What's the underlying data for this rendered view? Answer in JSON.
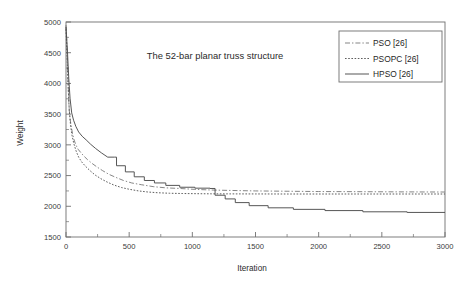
{
  "chart_data": {
    "type": "line",
    "title": "The 52-bar planar truss structure",
    "xlabel": "Iteration",
    "ylabel": "Weight",
    "xlim": [
      0,
      3000
    ],
    "ylim": [
      1500,
      5000
    ],
    "xticks": [
      0,
      500,
      1000,
      1500,
      2000,
      2500,
      3000
    ],
    "yticks": [
      1500,
      2000,
      2500,
      3000,
      3500,
      4000,
      4500,
      5000
    ],
    "xtick_labels": [
      "0",
      "500",
      "1000",
      "1500",
      "2000",
      "2500",
      "3000"
    ],
    "ytick_labels": [
      "1500",
      "2000",
      "2500",
      "3000",
      "3500",
      "4000",
      "4500",
      "5000"
    ],
    "grid": false,
    "legend_position": "top-right",
    "series": [
      {
        "name": "PSO [26]",
        "style": "dash-dot",
        "color": "#808080",
        "x": [
          0,
          8,
          14,
          20,
          26,
          34,
          42,
          52,
          64,
          78,
          95,
          115,
          140,
          170,
          205,
          245,
          290,
          340,
          395,
          455,
          520,
          600,
          690,
          790,
          900,
          1020,
          1150,
          1300,
          1500,
          1750,
          2000,
          2300,
          2600,
          3000
        ],
        "y": [
          4950,
          4600,
          4180,
          3820,
          3560,
          3400,
          3290,
          3180,
          3080,
          3000,
          2930,
          2880,
          2820,
          2760,
          2700,
          2640,
          2580,
          2520,
          2470,
          2420,
          2380,
          2350,
          2320,
          2300,
          2290,
          2275,
          2265,
          2258,
          2250,
          2245,
          2240,
          2238,
          2235,
          2232
        ]
      },
      {
        "name": "PSOPC [26]",
        "style": "dotted",
        "color": "#555555",
        "x": [
          0,
          10,
          18,
          26,
          36,
          48,
          62,
          80,
          100,
          125,
          155,
          190,
          230,
          275,
          325,
          380,
          440,
          505,
          575,
          650,
          730,
          820,
          920,
          1030,
          1150,
          1300,
          1500,
          1750,
          2000,
          2300,
          2600,
          3000
        ],
        "y": [
          4880,
          4350,
          3900,
          3560,
          3320,
          3150,
          3020,
          2900,
          2800,
          2720,
          2650,
          2580,
          2510,
          2450,
          2395,
          2345,
          2305,
          2275,
          2250,
          2232,
          2220,
          2212,
          2208,
          2205,
          2203,
          2202,
          2201,
          2200,
          2200,
          2200,
          2200,
          2200
        ]
      },
      {
        "name": "HPSO [26]",
        "style": "solid",
        "color": "#4d4d4d",
        "x": [
          0,
          12,
          22,
          32,
          45,
          60,
          78,
          100,
          128,
          160,
          195,
          235,
          280,
          330,
          385,
          400,
          400,
          470,
          470,
          540,
          540,
          620,
          620,
          700,
          700,
          790,
          790,
          900,
          900,
          1020,
          1020,
          1140,
          1140,
          1180,
          1180,
          1260,
          1260,
          1340,
          1340,
          1450,
          1450,
          1600,
          1600,
          1800,
          1800,
          2050,
          2050,
          2350,
          2350,
          2700,
          2700,
          3000
        ],
        "y": [
          4920,
          4500,
          4080,
          3760,
          3520,
          3400,
          3300,
          3210,
          3140,
          3080,
          3010,
          2940,
          2870,
          2800,
          2800,
          2800,
          2660,
          2660,
          2560,
          2560,
          2480,
          2480,
          2420,
          2420,
          2380,
          2380,
          2340,
          2340,
          2310,
          2310,
          2295,
          2295,
          2290,
          2290,
          2180,
          2180,
          2120,
          2120,
          2060,
          2060,
          2010,
          2010,
          1975,
          1975,
          1950,
          1950,
          1930,
          1930,
          1910,
          1910,
          1900,
          1900
        ]
      }
    ]
  },
  "legend": {
    "entries": [
      {
        "label": "PSO [26]"
      },
      {
        "label": "PSOPC [26]"
      },
      {
        "label": "HPSO [26]"
      }
    ]
  }
}
